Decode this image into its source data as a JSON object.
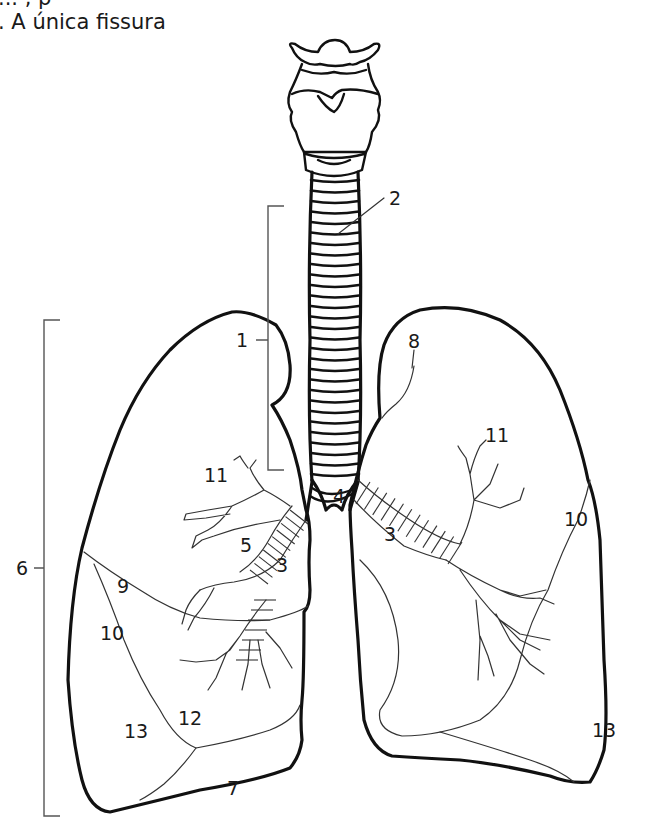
{
  "caption": {
    "partial_top": "... , p",
    "text": ". A única fissura"
  },
  "diagram": {
    "labels": {
      "l1": "1",
      "l2": "2",
      "l3_left": "3",
      "l3_right": "3",
      "l4": "4",
      "l5": "5",
      "l6": "6",
      "l7": "7",
      "l8": "8",
      "l9": "9",
      "l10_left": "10",
      "l10_right": "10",
      "l11_left": "11",
      "l11_right": "11",
      "l12": "12",
      "l13_left": "13",
      "l13_right": "13"
    }
  }
}
